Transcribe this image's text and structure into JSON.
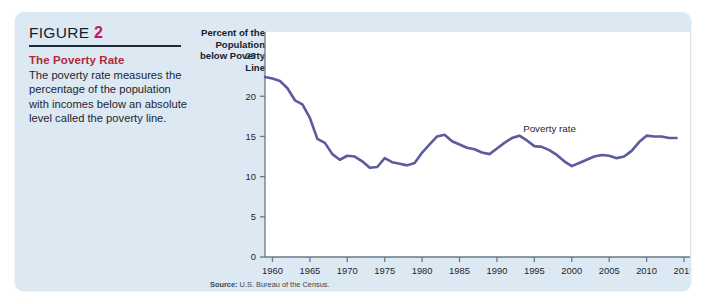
{
  "figure": {
    "header_label": "FIGURE",
    "header_number": "2",
    "subtitle": "The Poverty Rate",
    "blurb": "The poverty rate measures the percentage of the population with incomes below an absolute level called the poverty line.",
    "source_prefix": "Source:",
    "source_text": "U.S. Bureau of the Census."
  },
  "colors": {
    "card_background": "#dce8f2",
    "plot_background": "#ffffff",
    "line": "#5b5b9e",
    "axis": "#6b7885",
    "figure_number": "#c2185b",
    "subtitle": "#b02a37",
    "text": "#1b2733"
  },
  "chart_data": {
    "type": "line",
    "title": "The Poverty Rate",
    "xlabel": "",
    "ylabel": "Percent of the Population below Poverty Line",
    "ylabel_lines": [
      "Percent of the",
      "Population",
      "below Poverty",
      "Line"
    ],
    "xlim": [
      1959,
      2015
    ],
    "ylim": [
      0,
      27
    ],
    "yticks": [
      0,
      5,
      10,
      15,
      20,
      25
    ],
    "xticks": [
      1960,
      1965,
      1970,
      1975,
      1980,
      1985,
      1990,
      1995,
      2000,
      2005,
      2010,
      2015
    ],
    "grid": false,
    "legend": "none",
    "annotations": [
      {
        "text": "Poverty rate",
        "x": 1993.5,
        "y": 15.6
      }
    ],
    "series": [
      {
        "name": "Poverty rate",
        "color": "#5b5b9e",
        "x": [
          1959,
          1960,
          1961,
          1962,
          1963,
          1964,
          1965,
          1966,
          1967,
          1968,
          1969,
          1970,
          1971,
          1972,
          1973,
          1974,
          1975,
          1976,
          1977,
          1978,
          1979,
          1980,
          1981,
          1982,
          1983,
          1984,
          1985,
          1986,
          1987,
          1988,
          1989,
          1990,
          1991,
          1992,
          1993,
          1994,
          1995,
          1996,
          1997,
          1998,
          1999,
          2000,
          2001,
          2002,
          2003,
          2004,
          2005,
          2006,
          2007,
          2008,
          2009,
          2010,
          2011,
          2012,
          2013,
          2014
        ],
        "values": [
          22.4,
          22.2,
          21.9,
          21.0,
          19.5,
          19.0,
          17.3,
          14.7,
          14.2,
          12.8,
          12.1,
          12.6,
          12.5,
          11.9,
          11.1,
          11.2,
          12.3,
          11.8,
          11.6,
          11.4,
          11.7,
          13.0,
          14.0,
          15.0,
          15.2,
          14.4,
          14.0,
          13.6,
          13.4,
          13.0,
          12.8,
          13.5,
          14.2,
          14.8,
          15.1,
          14.5,
          13.8,
          13.7,
          13.3,
          12.7,
          11.9,
          11.3,
          11.7,
          12.1,
          12.5,
          12.7,
          12.6,
          12.3,
          12.5,
          13.2,
          14.3,
          15.1,
          15.0,
          15.0,
          14.8,
          14.8
        ]
      }
    ]
  }
}
